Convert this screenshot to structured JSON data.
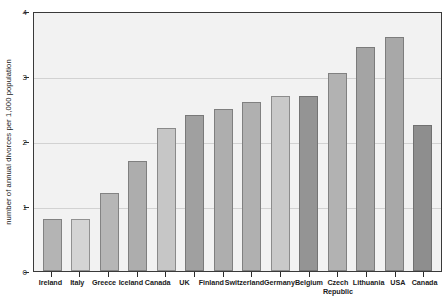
{
  "chart_data": {
    "type": "bar",
    "title": "",
    "xlabel": "",
    "ylabel": "number of annual divorces per 1,000 population",
    "ylim": [
      0,
      4
    ],
    "yticks": [
      0,
      1,
      2,
      3,
      4
    ],
    "ytick_labels": [
      "0",
      "1",
      "2",
      "3",
      "4"
    ],
    "grid": true,
    "legend": "none",
    "categories": [
      "Ireland",
      "Italy",
      "Greece",
      "Iceland",
      "Canada",
      "UK",
      "Finland",
      "Switzerland",
      "Germany",
      "Belgium",
      "Czech Republic",
      "Lithuania",
      "USA",
      "Canada"
    ],
    "values": [
      0.8,
      0.8,
      1.2,
      1.7,
      2.2,
      2.4,
      2.5,
      2.6,
      2.7,
      2.7,
      3.05,
      3.45,
      3.6,
      2.25
    ],
    "bar_colors": [
      "#b4b4b4",
      "#d4d4d4",
      "#b6b6b6",
      "#adadad",
      "#c6c6c6",
      "#a0a0a0",
      "#aeaeae",
      "#b0b0b0",
      "#c9c9c9",
      "#949494",
      "#b2b2b2",
      "#a4a4a4",
      "#a8a8a8",
      "#8e8e8e"
    ],
    "plot_background": "#f2f2f2",
    "gridline_color": "#d2d2d2",
    "axis_color": "#3a3a3a"
  }
}
